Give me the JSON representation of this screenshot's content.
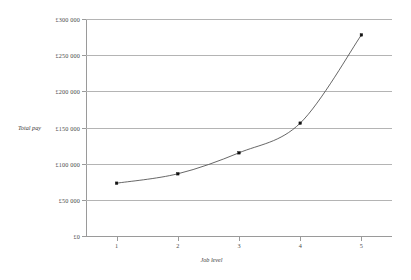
{
  "chart_data": {
    "type": "line",
    "title": "",
    "xlabel": "Job level",
    "ylabel": "Total pay",
    "categories": [
      "1",
      "2",
      "3",
      "4",
      "5"
    ],
    "x": [
      1,
      2,
      3,
      4,
      5
    ],
    "values": [
      73000,
      86000,
      115000,
      156000,
      278000
    ],
    "series": [
      {
        "name": "Total pay",
        "values": [
          73000,
          86000,
          115000,
          156000,
          278000
        ]
      }
    ],
    "ylim": [
      0,
      300000
    ],
    "xlim": [
      0.5,
      5.5
    ],
    "ytick_values": [
      0,
      50000,
      100000,
      150000,
      200000,
      250000,
      300000
    ],
    "ytick_labels": [
      "£0",
      "£50 000",
      "£100 000",
      "£150 000",
      "£200 000",
      "£250 000",
      "£300 000"
    ],
    "xtick_labels": [
      "1",
      "2",
      "3",
      "4",
      "5"
    ],
    "grid": true,
    "grid_axis": "y",
    "legend": false,
    "legend_position": "none",
    "marker": "square",
    "line_color": "#4b4b4b",
    "marker_color": "#111111",
    "grid_color": "#b4b4b4",
    "axis_color": "#9a9a9a",
    "background_color": "#ffffff"
  }
}
